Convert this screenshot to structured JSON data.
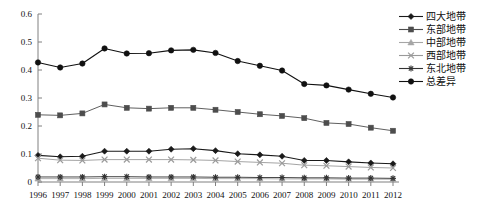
{
  "chart_data": {
    "type": "line",
    "title": "",
    "xlabel": "",
    "ylabel": "",
    "ylim": [
      0,
      0.6
    ],
    "ytick_labels": [
      "0",
      "0.1",
      "0.2",
      "0.3",
      "0.4",
      "0.5",
      "0.6"
    ],
    "ytick_values": [
      0,
      0.1,
      0.2,
      0.3,
      0.4,
      0.5,
      0.6
    ],
    "grid": false,
    "legend_position": "right-top",
    "categories": [
      1996,
      1997,
      1998,
      1999,
      2000,
      2001,
      2002,
      2003,
      2004,
      2005,
      2006,
      2007,
      2008,
      2009,
      2010,
      2011,
      2012
    ],
    "x_tick_labels": [
      "1996",
      "1997",
      "1998",
      "1999",
      "2000",
      "2001",
      "2002",
      "2003",
      "2004",
      "2005",
      "2006",
      "2007",
      "2008",
      "2009",
      "2010",
      "2011",
      "2012"
    ],
    "series": [
      {
        "name": "四大地带",
        "marker": "diamond",
        "color": "#1a1a1a",
        "values": [
          0.095,
          0.09,
          0.092,
          0.11,
          0.11,
          0.11,
          0.117,
          0.119,
          0.112,
          0.101,
          0.097,
          0.092,
          0.077,
          0.077,
          0.072,
          0.068,
          0.065
        ]
      },
      {
        "name": "东部地带",
        "marker": "square",
        "color": "#4d4d4d",
        "values": [
          0.24,
          0.238,
          0.245,
          0.277,
          0.265,
          0.262,
          0.265,
          0.265,
          0.258,
          0.25,
          0.242,
          0.236,
          0.228,
          0.211,
          0.207,
          0.194,
          0.183
        ]
      },
      {
        "name": "中部地带",
        "marker": "triangle",
        "color": "#a6a6a6",
        "values": [
          0.012,
          0.012,
          0.012,
          0.013,
          0.013,
          0.013,
          0.013,
          0.013,
          0.012,
          0.012,
          0.012,
          0.011,
          0.011,
          0.011,
          0.01,
          0.01,
          0.01
        ]
      },
      {
        "name": "西部地带",
        "marker": "cross",
        "color": "#9a9a9a",
        "values": [
          0.085,
          0.078,
          0.077,
          0.08,
          0.08,
          0.08,
          0.08,
          0.079,
          0.077,
          0.073,
          0.07,
          0.067,
          0.06,
          0.058,
          0.055,
          0.052,
          0.05
        ]
      },
      {
        "name": "东北地带",
        "marker": "star",
        "color": "#333333",
        "values": [
          0.018,
          0.018,
          0.018,
          0.019,
          0.019,
          0.018,
          0.018,
          0.018,
          0.017,
          0.017,
          0.016,
          0.016,
          0.015,
          0.015,
          0.014,
          0.014,
          0.013
        ]
      },
      {
        "name": "总差异",
        "marker": "circle",
        "color": "#111111",
        "values": [
          0.427,
          0.409,
          0.423,
          0.477,
          0.459,
          0.46,
          0.47,
          0.472,
          0.461,
          0.432,
          0.415,
          0.398,
          0.35,
          0.345,
          0.33,
          0.315,
          0.302
        ]
      }
    ]
  }
}
